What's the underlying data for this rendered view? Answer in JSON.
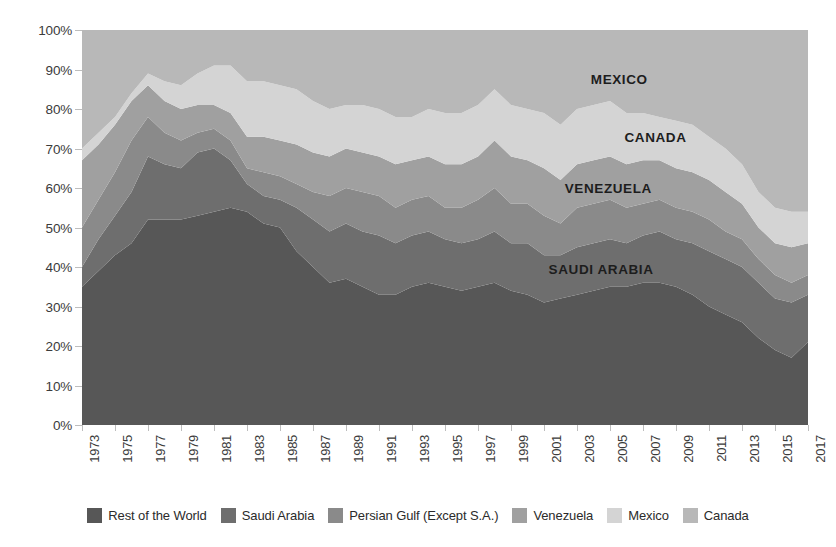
{
  "chart_data": {
    "type": "area",
    "stacked": true,
    "stack_mode": "percent_of_total_imports",
    "title": "",
    "subtitle": "",
    "xlabel": "",
    "ylabel": "",
    "xlim": [
      1973,
      2017
    ],
    "ylim": [
      0,
      100
    ],
    "grid": false,
    "legend_position": "bottom",
    "y_ticks": [
      "0%",
      "10%",
      "20%",
      "30%",
      "40%",
      "50%",
      "60%",
      "70%",
      "80%",
      "90%",
      "100%"
    ],
    "y_tick_values": [
      0,
      10,
      20,
      30,
      40,
      50,
      60,
      70,
      80,
      90,
      100
    ],
    "x_tick_labels": [
      "1973",
      "1975",
      "1977",
      "1979",
      "1981",
      "1983",
      "1985",
      "1987",
      "1989",
      "1991",
      "1993",
      "1995",
      "1997",
      "1999",
      "2001",
      "2003",
      "2005",
      "2007",
      "2009",
      "2011",
      "2013",
      "2015",
      "2017"
    ],
    "x": [
      1973,
      1974,
      1975,
      1976,
      1977,
      1978,
      1979,
      1980,
      1981,
      1982,
      1983,
      1984,
      1985,
      1986,
      1987,
      1988,
      1989,
      1990,
      1991,
      1992,
      1993,
      1994,
      1995,
      1996,
      1997,
      1998,
      1999,
      2000,
      2001,
      2002,
      2003,
      2004,
      2005,
      2006,
      2007,
      2008,
      2009,
      2010,
      2011,
      2012,
      2013,
      2014,
      2015,
      2016,
      2017
    ],
    "series": [
      {
        "name": "Rest of the World",
        "color": "#575757",
        "values": [
          35,
          39,
          43,
          46,
          52,
          52,
          52,
          53,
          54,
          55,
          54,
          51,
          50,
          44,
          40,
          36,
          37,
          35,
          33,
          33,
          35,
          36,
          35,
          34,
          35,
          36,
          34,
          33,
          31,
          32,
          33,
          34,
          35,
          35,
          36,
          36,
          35,
          33,
          30,
          28,
          26,
          22,
          19,
          17,
          21
        ]
      },
      {
        "name": "Saudi Arabia",
        "color": "#6e6e6e",
        "values": [
          5,
          8,
          10,
          13,
          16,
          14,
          13,
          16,
          16,
          12,
          7,
          7,
          7,
          11,
          12,
          13,
          14,
          14,
          15,
          13,
          13,
          13,
          12,
          12,
          12,
          13,
          12,
          13,
          12,
          11,
          12,
          12,
          12,
          11,
          12,
          13,
          12,
          13,
          14,
          14,
          14,
          14,
          13,
          14,
          12
        ]
      },
      {
        "name": "Persian Gulf (Except S.A.)",
        "color": "#8a8a8a",
        "values": [
          10,
          10,
          11,
          13,
          10,
          8,
          7,
          5,
          5,
          5,
          4,
          6,
          6,
          6,
          7,
          9,
          9,
          10,
          10,
          9,
          9,
          9,
          8,
          9,
          10,
          11,
          10,
          10,
          10,
          8,
          10,
          10,
          10,
          9,
          8,
          8,
          8,
          8,
          8,
          7,
          7,
          6,
          6,
          5,
          5
        ]
      },
      {
        "name": "Venezuela",
        "color": "#a0a0a0",
        "values": [
          17,
          14,
          12,
          10,
          8,
          8,
          8,
          7,
          6,
          7,
          8,
          9,
          9,
          10,
          10,
          10,
          10,
          10,
          10,
          11,
          10,
          10,
          11,
          11,
          11,
          12,
          12,
          11,
          12,
          11,
          11,
          11,
          11,
          11,
          11,
          10,
          10,
          10,
          10,
          10,
          9,
          8,
          8,
          9,
          8
        ]
      },
      {
        "name": "Mexico",
        "color": "#d4d4d4",
        "values": [
          3,
          3,
          2,
          2,
          3,
          5,
          6,
          8,
          10,
          12,
          14,
          14,
          14,
          14,
          13,
          12,
          11,
          12,
          12,
          12,
          11,
          12,
          13,
          13,
          13,
          13,
          13,
          13,
          14,
          14,
          14,
          14,
          14,
          13,
          12,
          11,
          12,
          12,
          11,
          11,
          10,
          9,
          9,
          9,
          8
        ]
      },
      {
        "name": "Canada",
        "color": "#b8b8b8",
        "values": [
          30,
          26,
          22,
          16,
          11,
          13,
          14,
          11,
          9,
          9,
          13,
          13,
          14,
          15,
          18,
          20,
          19,
          19,
          20,
          22,
          22,
          20,
          21,
          21,
          19,
          15,
          19,
          20,
          21,
          24,
          20,
          19,
          18,
          21,
          21,
          22,
          23,
          24,
          27,
          30,
          34,
          41,
          45,
          46,
          46
        ]
      }
    ],
    "annotations": [
      {
        "label": "MEXICO",
        "x_pct": 74.0,
        "y_pct": 12.5
      },
      {
        "label": "CANADA",
        "x_pct": 79.0,
        "y_pct": 27.0
      },
      {
        "label": "VENEZUELA",
        "x_pct": 72.5,
        "y_pct": 40.0
      },
      {
        "label": "SAUDI ARABIA",
        "x_pct": 71.5,
        "y_pct": 60.5
      }
    ]
  },
  "legend": {
    "items": [
      {
        "label": "Rest of the World",
        "color": "#575757"
      },
      {
        "label": "Saudi Arabia",
        "color": "#6e6e6e"
      },
      {
        "label": "Persian Gulf (Except S.A.)",
        "color": "#8a8a8a"
      },
      {
        "label": "Venezuela",
        "color": "#a0a0a0"
      },
      {
        "label": "Mexico",
        "color": "#d4d4d4"
      },
      {
        "label": "Canada",
        "color": "#b8b8b8"
      }
    ]
  }
}
